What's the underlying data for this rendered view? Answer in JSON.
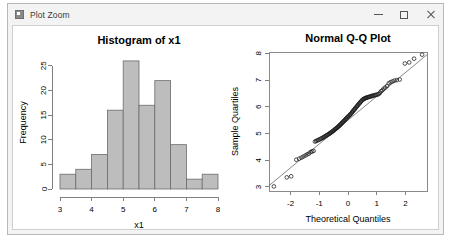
{
  "window": {
    "title": "Plot Zoom",
    "icon": "plot-window-icon",
    "controls": {
      "minimize": "minimize-icon",
      "maximize": "maximize-icon",
      "close": "close-icon"
    }
  },
  "chart_data": [
    {
      "type": "bar",
      "name": "histogram-x1",
      "title": "Histogram of x1",
      "xlabel": "x1",
      "ylabel": "Frequency",
      "xlim": [
        3,
        8
      ],
      "ylim": [
        0,
        27
      ],
      "xticks": [
        3,
        4,
        5,
        6,
        7,
        8
      ],
      "yticks": [
        0,
        5,
        10,
        15,
        20,
        25
      ],
      "bin_width": 0.5,
      "bin_edges": [
        3.0,
        3.5,
        4.0,
        4.5,
        5.0,
        5.5,
        6.0,
        6.5,
        7.0,
        7.5,
        8.0
      ],
      "categories": [
        "3.0-3.5",
        "3.5-4.0",
        "4.0-4.5",
        "4.5-5.0",
        "5.0-5.5",
        "5.5-6.0",
        "6.0-6.5",
        "6.5-7.0",
        "7.0-7.5",
        "7.5-8.0"
      ],
      "values": [
        3,
        4,
        7,
        16,
        26,
        17,
        22,
        9,
        2,
        3
      ],
      "bar_fill": "#bdbdbd",
      "bar_stroke": "#6b6b6b",
      "grid": false,
      "legend": null
    },
    {
      "type": "scatter",
      "name": "normal-qq-plot",
      "title": "Normal Q-Q Plot",
      "xlabel": "Theoretical Quantiles",
      "ylabel": "Sample Quartiles",
      "xlim": [
        -2.75,
        2.75
      ],
      "ylim": [
        2.85,
        8.05
      ],
      "xticks": [
        -2,
        -1,
        0,
        1,
        2
      ],
      "yticks": [
        3,
        4,
        5,
        6,
        7,
        8
      ],
      "grid": false,
      "legend": null,
      "reference_line": {
        "x": [
          -2.75,
          2.75
        ],
        "y": [
          3.05,
          7.95
        ],
        "style": "solid"
      },
      "point_style": "open-circle",
      "points": [
        [
          -2.58,
          3.02
        ],
        [
          -2.13,
          3.36
        ],
        [
          -1.98,
          3.4
        ],
        [
          -1.8,
          4.02
        ],
        [
          -1.7,
          4.06
        ],
        [
          -1.62,
          4.1
        ],
        [
          -1.55,
          4.14
        ],
        [
          -1.48,
          4.18
        ],
        [
          -1.42,
          4.22
        ],
        [
          -1.36,
          4.25
        ],
        [
          -1.3,
          4.31
        ],
        [
          -1.25,
          4.33
        ],
        [
          -1.2,
          4.35
        ],
        [
          -1.15,
          4.7
        ],
        [
          -1.11,
          4.72
        ],
        [
          -1.07,
          4.74
        ],
        [
          -1.03,
          4.76
        ],
        [
          -0.99,
          4.78
        ],
        [
          -0.95,
          4.8
        ],
        [
          -0.92,
          4.82
        ],
        [
          -0.88,
          4.84
        ],
        [
          -0.85,
          4.86
        ],
        [
          -0.82,
          4.88
        ],
        [
          -0.79,
          4.9
        ],
        [
          -0.76,
          4.92
        ],
        [
          -0.73,
          4.94
        ],
        [
          -0.7,
          4.96
        ],
        [
          -0.67,
          4.98
        ],
        [
          -0.64,
          5.0
        ],
        [
          -0.62,
          5.02
        ],
        [
          -0.59,
          5.04
        ],
        [
          -0.56,
          5.06
        ],
        [
          -0.54,
          5.08
        ],
        [
          -0.51,
          5.1
        ],
        [
          -0.49,
          5.12
        ],
        [
          -0.46,
          5.15
        ],
        [
          -0.44,
          5.17
        ],
        [
          -0.41,
          5.19
        ],
        [
          -0.39,
          5.21
        ],
        [
          -0.37,
          5.23
        ],
        [
          -0.34,
          5.25
        ],
        [
          -0.32,
          5.28
        ],
        [
          -0.3,
          5.3
        ],
        [
          -0.27,
          5.32
        ],
        [
          -0.25,
          5.35
        ],
        [
          -0.23,
          5.37
        ],
        [
          -0.21,
          5.4
        ],
        [
          -0.18,
          5.42
        ],
        [
          -0.16,
          5.45
        ],
        [
          -0.14,
          5.47
        ],
        [
          -0.12,
          5.5
        ],
        [
          -0.09,
          5.52
        ],
        [
          -0.07,
          5.55
        ],
        [
          -0.05,
          5.57
        ],
        [
          -0.03,
          5.6
        ],
        [
          0.0,
          5.62
        ],
        [
          0.02,
          5.65
        ],
        [
          0.05,
          5.68
        ],
        [
          0.07,
          5.7
        ],
        [
          0.09,
          5.73
        ],
        [
          0.12,
          5.76
        ],
        [
          0.14,
          5.79
        ],
        [
          0.16,
          5.82
        ],
        [
          0.18,
          5.85
        ],
        [
          0.21,
          5.88
        ],
        [
          0.23,
          5.91
        ],
        [
          0.25,
          5.94
        ],
        [
          0.27,
          5.97
        ],
        [
          0.3,
          6.0
        ],
        [
          0.32,
          6.03
        ],
        [
          0.34,
          6.06
        ],
        [
          0.37,
          6.09
        ],
        [
          0.39,
          6.12
        ],
        [
          0.41,
          6.15
        ],
        [
          0.44,
          6.18
        ],
        [
          0.46,
          6.21
        ],
        [
          0.49,
          6.24
        ],
        [
          0.51,
          6.27
        ],
        [
          0.54,
          6.28
        ],
        [
          0.56,
          6.3
        ],
        [
          0.59,
          6.32
        ],
        [
          0.62,
          6.33
        ],
        [
          0.64,
          6.34
        ],
        [
          0.67,
          6.35
        ],
        [
          0.7,
          6.36
        ],
        [
          0.73,
          6.37
        ],
        [
          0.76,
          6.38
        ],
        [
          0.79,
          6.39
        ],
        [
          0.82,
          6.4
        ],
        [
          0.85,
          6.41
        ],
        [
          0.88,
          6.42
        ],
        [
          0.92,
          6.43
        ],
        [
          0.95,
          6.44
        ],
        [
          0.99,
          6.45
        ],
        [
          1.03,
          6.46
        ],
        [
          1.07,
          6.48
        ],
        [
          1.11,
          6.52
        ],
        [
          1.15,
          6.58
        ],
        [
          1.2,
          6.62
        ],
        [
          1.25,
          6.68
        ],
        [
          1.3,
          6.72
        ],
        [
          1.36,
          6.78
        ],
        [
          1.42,
          6.88
        ],
        [
          1.48,
          6.92
        ],
        [
          1.55,
          6.95
        ],
        [
          1.62,
          6.98
        ],
        [
          1.7,
          7.0
        ],
        [
          1.8,
          7.02
        ],
        [
          1.98,
          7.62
        ],
        [
          2.13,
          7.66
        ],
        [
          2.3,
          7.8
        ],
        [
          2.58,
          7.95
        ]
      ]
    }
  ]
}
